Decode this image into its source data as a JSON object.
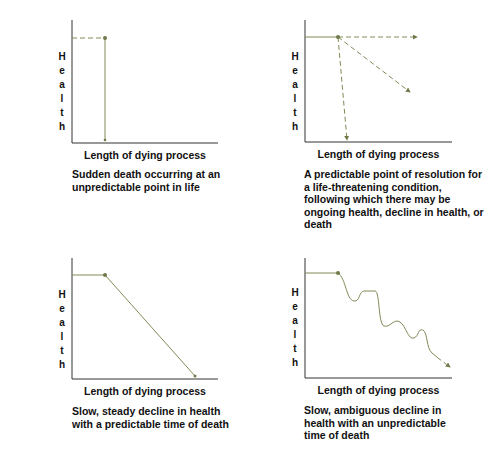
{
  "colors": {
    "axis": "#333333",
    "trajectory": "#7f8c57",
    "marker": "#6e7a48",
    "text": "#111111"
  },
  "panels": [
    {
      "id": "sudden-death",
      "ylabel": "Health",
      "xlabel": "Length of dying process",
      "caption": "Sudden death occurring at an unpredictable point in life"
    },
    {
      "id": "predictable-resolution",
      "ylabel": "Health",
      "xlabel": "Length of dying process",
      "caption": "A predictable point of resolution for a life-threatening condition, following which there may be ongoing health, decline in health, or death"
    },
    {
      "id": "steady-decline",
      "ylabel": "Health",
      "xlabel": "Length of dying process",
      "caption": "Slow, steady decline in health with a predictable time of death"
    },
    {
      "id": "ambiguous-decline",
      "ylabel": "Health",
      "xlabel": "Length of dying process",
      "caption": "Slow, ambiguous decline in health with an unpredictable time of death"
    }
  ]
}
